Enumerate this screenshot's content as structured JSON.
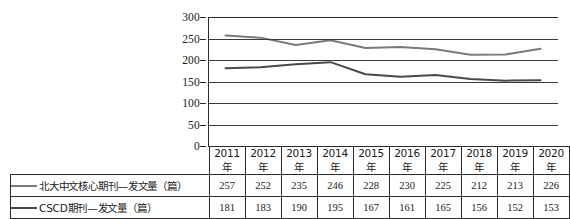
{
  "chart_data": {
    "type": "line",
    "title": "",
    "xlabel": "",
    "ylabel": "",
    "ylim": [
      0,
      300
    ],
    "ytick_step": 50,
    "yticks": [
      300,
      250,
      200,
      150,
      100,
      50,
      0
    ],
    "grid": true,
    "legend_position": "bottom-table",
    "categories": [
      "2011年",
      "2012年",
      "2013年",
      "2014年",
      "2015年",
      "2016年",
      "2017年",
      "2018年",
      "2019年",
      "2020年"
    ],
    "series": [
      {
        "name": "北大中文核心期刊—发文量（篇）",
        "color": "#7a7a7a",
        "values": [
          257,
          252,
          235,
          246,
          228,
          230,
          225,
          212,
          213,
          226
        ]
      },
      {
        "name": "CSCD期刊—发文量（篇）",
        "color": "#4a4a4a",
        "values": [
          181,
          183,
          190,
          195,
          167,
          161,
          165,
          156,
          152,
          153
        ]
      }
    ]
  },
  "axis": {
    "y_labels": [
      "300",
      "250",
      "200",
      "150",
      "100",
      "50",
      "0"
    ]
  },
  "table": {
    "header_row": [
      "2011年",
      "2012年",
      "2013年",
      "2014年",
      "2015年",
      "2016年",
      "2017年",
      "2018年",
      "2019年",
      "2020年"
    ],
    "rows": [
      {
        "label": "北大中文核心期刊—发文量（篇）",
        "values": [
          "257",
          "252",
          "235",
          "246",
          "228",
          "230",
          "225",
          "212",
          "213",
          "226"
        ]
      },
      {
        "label": "CSCD期刊—发文量（篇）",
        "values": [
          "181",
          "183",
          "190",
          "195",
          "167",
          "161",
          "165",
          "156",
          "152",
          "153"
        ]
      }
    ]
  }
}
